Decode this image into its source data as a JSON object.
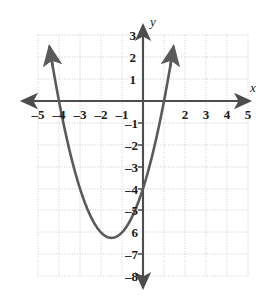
{
  "figure": {
    "kind": "cartesian-graph",
    "background": "#ffffff",
    "curve_color": "#5a5a5a",
    "axis_color": "#4d4d4d",
    "grid_color": "#b9b9b9",
    "label_color": "#1a1a1a"
  },
  "chart_data": {
    "type": "line",
    "title": "",
    "xlabel": "x",
    "ylabel": "y",
    "xlim": [
      -5,
      5
    ],
    "ylim": [
      -8,
      3
    ],
    "grid": true,
    "grid_step": 1,
    "legend": "none",
    "x_tick_labels": [
      "–5",
      "–4",
      "–3",
      "–2",
      "–1",
      "2",
      "3",
      "4",
      "5"
    ],
    "x_tick_values": [
      -5,
      -4,
      -3,
      -2,
      -1,
      2,
      3,
      4,
      5
    ],
    "y_tick_labels": [
      "3",
      "2",
      "1",
      "–1",
      "–2",
      "–3",
      "–4",
      "–5",
      "6",
      "–7",
      "–8"
    ],
    "y_tick_values": [
      3,
      2,
      1,
      -1,
      -2,
      -3,
      -4,
      -5,
      -6,
      -7,
      -8
    ],
    "series": [
      {
        "name": "parabola",
        "equation": "y = x^2 + 3x - 4",
        "vertex": [
          -1.5,
          -6.25
        ],
        "roots": [
          -4,
          1
        ],
        "y_intercept": -4,
        "arrowheads": "both-ends-up",
        "x": [
          -4.55,
          -4.4,
          -4.2,
          -4,
          -3.8,
          -3.6,
          -3.4,
          -3.2,
          -3,
          -2.8,
          -2.6,
          -2.4,
          -2.2,
          -2,
          -1.8,
          -1.6,
          -1.5,
          -1.4,
          -1.2,
          -1,
          -0.8,
          -0.6,
          -0.4,
          -0.2,
          0,
          0.2,
          0.4,
          0.6,
          0.8,
          1,
          1.2,
          1.4,
          1.55
        ],
        "y": [
          -0.95,
          -1.84,
          -2.96,
          -4,
          -4.96,
          -5.84,
          -6.64,
          -7.36,
          -8,
          -6.56,
          -5.04,
          -5.44,
          -5.76,
          -6,
          -6.16,
          -6.24,
          -6.25,
          -6.24,
          -6.16,
          -6,
          -5.76,
          -5.44,
          -5.04,
          -4.56,
          -4,
          -3.36,
          -2.64,
          -1.84,
          -0.96,
          0,
          1.04,
          2.16,
          2.8
        ]
      }
    ],
    "axis_arrow_labels": {
      "x_axis": "x",
      "y_axis": "y"
    }
  }
}
